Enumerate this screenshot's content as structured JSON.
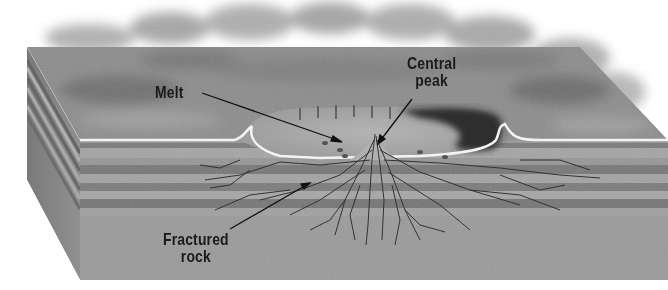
{
  "diagram": {
    "labels": {
      "melt": "Melt",
      "central_peak_line1": "Central",
      "central_peak_line2": "peak",
      "fractured_rock_line1": "Fractured",
      "fractured_rock_line2": "rock"
    },
    "colors": {
      "background": "#ffffff",
      "surface": "#8a8a8a",
      "surface_dark": "#6e6e6e",
      "crater_floor": "#a9a9a9",
      "crater_shadow": "#2a2a2a",
      "layer_light": "#9c9c9c",
      "layer_dark": "#767676",
      "fracture": "#3a3a3a",
      "rim_highlight": "#f2f2f2",
      "text": "#1a1a1a"
    }
  }
}
